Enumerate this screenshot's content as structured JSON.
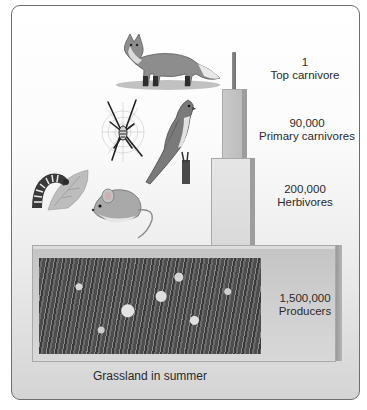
{
  "diagram": {
    "type": "pyramid of numbers",
    "caption": "Grassland in summer",
    "levels": [
      {
        "count": "1",
        "name": "Top carnivore",
        "organisms": [
          "fox"
        ]
      },
      {
        "count": "90,000",
        "name": "Primary carnivores",
        "organisms": [
          "spider",
          "bird (kestrel)"
        ]
      },
      {
        "count": "200,000",
        "name": "Herbivores",
        "organisms": [
          "caterpillar",
          "mouse"
        ]
      },
      {
        "count": "1,500,000",
        "name": "Producers",
        "organisms": [
          "grassland plants"
        ]
      }
    ]
  },
  "colors": {
    "frame_border": "#6e6e6e",
    "bar_primary": "#c4c4c4",
    "bar_herbivore": "#e0e0e0",
    "bar_producer": "#cccccc",
    "bar_side": "#9d9d9d"
  }
}
